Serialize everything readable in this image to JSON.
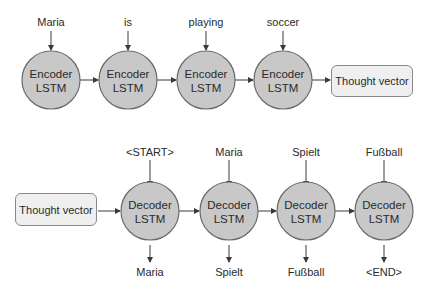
{
  "encoder": {
    "inputs": [
      "Maria",
      "is",
      "playing",
      "soccer"
    ],
    "nodes": [
      {
        "line1": "Encoder",
        "line2": "LSTM"
      },
      {
        "line1": "Encoder",
        "line2": "LSTM"
      },
      {
        "line1": "Encoder",
        "line2": "LSTM"
      },
      {
        "line1": "Encoder",
        "line2": "LSTM"
      }
    ],
    "output_box": "Thought vector"
  },
  "decoder": {
    "input_box": "Thought vector",
    "inputs": [
      "<START>",
      "Maria",
      "Spielt",
      "Fußball"
    ],
    "nodes": [
      {
        "line1": "Decoder",
        "line2": "LSTM"
      },
      {
        "line1": "Decoder",
        "line2": "LSTM"
      },
      {
        "line1": "Decoder",
        "line2": "LSTM"
      },
      {
        "line1": "Decoder",
        "line2": "LSTM"
      }
    ],
    "outputs": [
      "Maria",
      "Spielt",
      "Fußball",
      "<END>"
    ]
  },
  "colors": {
    "node_fill": "#c8c8c8",
    "node_stroke": "#6a6a6a",
    "box_fill": "#efefef",
    "arrow": "#3a3a3a"
  }
}
